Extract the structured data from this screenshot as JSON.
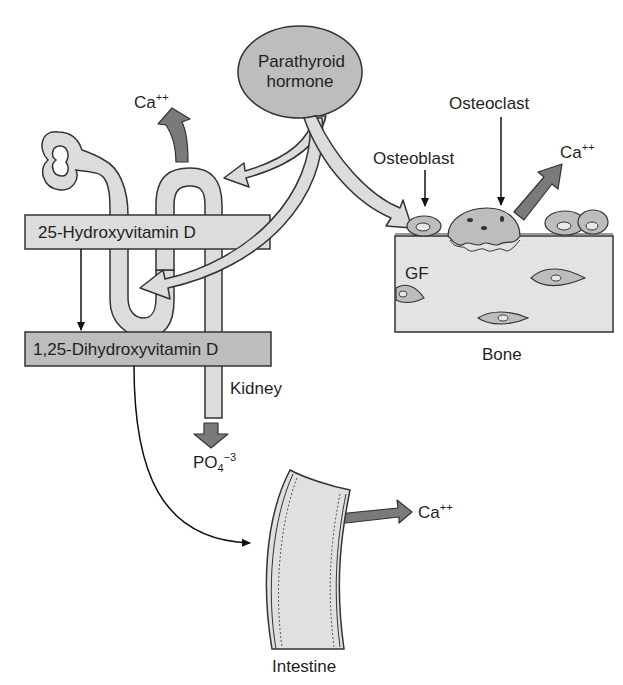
{
  "colors": {
    "background": "#ffffff",
    "light_fill": "#dcdcdc",
    "medium_fill": "#bdbdbd",
    "dark_arrow": "#7a7a7a",
    "outline": "#333333"
  },
  "nodes": {
    "pth": {
      "line1": "Parathyroid",
      "line2": "hormone"
    },
    "vitd25": {
      "label": "25-Hydroxyvitamin D"
    },
    "vitd125": {
      "label": "1,25-Dihydroxyvitamin D"
    },
    "kidney": {
      "label": "Kidney"
    },
    "bone": {
      "label": "Bone"
    },
    "intestine": {
      "label": "Intestine"
    },
    "osteoblast": {
      "label": "Osteoblast"
    },
    "osteoclast": {
      "label": "Osteoclast"
    },
    "gf": {
      "label": "GF"
    }
  },
  "ions": {
    "ca_kidney": {
      "base": "Ca",
      "sup": "++"
    },
    "ca_bone": {
      "base": "Ca",
      "sup": "++"
    },
    "ca_intestine": {
      "base": "Ca",
      "sup": "++"
    },
    "phosphate": {
      "base": "PO",
      "sub": "4",
      "sup": "−3"
    }
  },
  "edges": [
    {
      "from": "Parathyroid hormone",
      "to": "Kidney (tubule)",
      "type": "broad-arrow"
    },
    {
      "from": "Parathyroid hormone",
      "to": "Kidney (1-hydroxylation loop)",
      "type": "broad-arrow"
    },
    {
      "from": "Parathyroid hormone",
      "to": "Osteoblast",
      "type": "broad-arrow"
    },
    {
      "from": "25-Hydroxyvitamin D",
      "to": "1,25-Dihydroxyvitamin D",
      "type": "thin-arrow"
    },
    {
      "from": "1,25-Dihydroxyvitamin D",
      "to": "Intestine",
      "type": "thin-arrow"
    },
    {
      "from": "Kidney",
      "to": "Ca++ (reabsorption)",
      "type": "dark-arrow"
    },
    {
      "from": "Kidney",
      "to": "PO4-3 (excretion)",
      "type": "dark-arrow"
    },
    {
      "from": "Bone",
      "to": "Ca++ (release)",
      "type": "dark-arrow"
    },
    {
      "from": "Intestine",
      "to": "Ca++ (absorption)",
      "type": "dark-arrow"
    },
    {
      "from": "Osteoblast",
      "to": "GF",
      "type": "dark-arrow"
    }
  ]
}
